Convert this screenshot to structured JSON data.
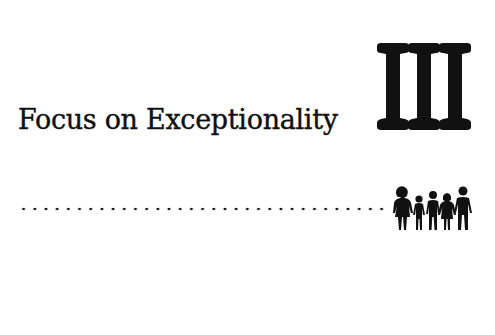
{
  "chapter": {
    "title": "Focus on Exceptionality",
    "part_numeral": "III",
    "decorations": {
      "divider": "dotted-line",
      "icon": "family-group-icon",
      "figure_count": 5
    },
    "colors": {
      "ink": "#111111",
      "background": "#ffffff"
    }
  }
}
